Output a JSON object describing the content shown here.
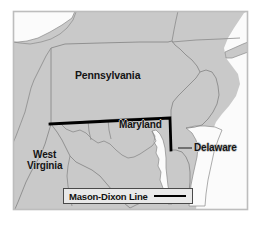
{
  "figure": {
    "type": "reference-map",
    "subject": "Mason-Dixon Line",
    "width": 262,
    "height": 227
  },
  "colors": {
    "land_fill": "#c9c9c9",
    "water_fill": "#fbfbfb",
    "border_stroke": "#8a8a8a",
    "mason_dixon_stroke": "#000000",
    "frame_stroke": "#bdbdbd",
    "label_text": "#141414",
    "legend_background": "#e9e9e9",
    "legend_border": "#4a4a4a"
  },
  "labels": {
    "pennsylvania": "Pennsylvania",
    "maryland": "Maryland",
    "delaware": "Delaware",
    "west_virginia_line1": "West",
    "west_virginia_line2": "Virginia"
  },
  "legend": {
    "label": "Mason-Dixon Line",
    "swatch_style": "solid-thick-black-line"
  },
  "icons": {
    "delaware_leader": "leader-line-icon",
    "legend_line_sample": "line-sample-icon"
  }
}
